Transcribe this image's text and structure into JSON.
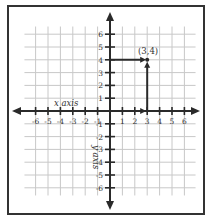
{
  "diagram": {
    "type": "coordinate-plane",
    "x_axis_label": "x axis",
    "y_axis_label": "y axis",
    "x_range": [
      -6,
      6
    ],
    "y_range": [
      -6,
      6
    ],
    "x_tick_labels": [
      "-6",
      "-5",
      "-4",
      "-3",
      "-2",
      "-1",
      "1",
      "2",
      "3",
      "4",
      "5",
      "6"
    ],
    "y_tick_labels": [
      "6",
      "5",
      "4",
      "3",
      "2",
      "1",
      "-1",
      "-2",
      "-3",
      "-4",
      "-5",
      "-6"
    ],
    "point": {
      "x": 3,
      "y": 4,
      "label": "(3,4)"
    },
    "colors": {
      "border": "#333333",
      "grid": "#c8c8c8",
      "axes": "#2a2a2a",
      "text": "#333333"
    }
  }
}
